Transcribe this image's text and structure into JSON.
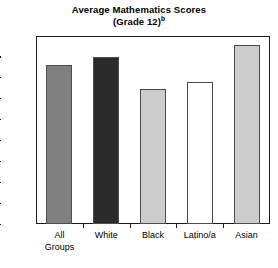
{
  "chart_data": {
    "type": "bar",
    "title": "Average Mathematics Scores",
    "subtitle": "(Grade 12)",
    "subtitle_superscript": "b",
    "categories": [
      "All Groups",
      "White",
      "Black",
      "Latino/a",
      "Asian"
    ],
    "category_lines": [
      [
        "All",
        "Groups"
      ],
      [
        "White"
      ],
      [
        "Black"
      ],
      [
        "Latino/a"
      ],
      [
        "Asian"
      ]
    ],
    "values": [
      152,
      160,
      129,
      136,
      171
    ],
    "xlabel": "",
    "ylabel": "",
    "ylim": [
      0,
      180
    ],
    "ytick_step": 20,
    "yticks": [
      180,
      160,
      140,
      120,
      100,
      80,
      60,
      40,
      20,
      0
    ],
    "ytick_labels": [
      "180",
      "160",
      "140",
      "120",
      "100",
      "80",
      "60",
      "40",
      "20",
      "0"
    ],
    "grid": false,
    "legend": false,
    "bar_colors": [
      "#808080",
      "#2b2b2b",
      "#cccccc",
      "#ffffff",
      "#cccccc"
    ],
    "bar_edge_color": "#4d4d4d",
    "axis_color": "#1a1a1a",
    "background_color": "#ffffff"
  }
}
